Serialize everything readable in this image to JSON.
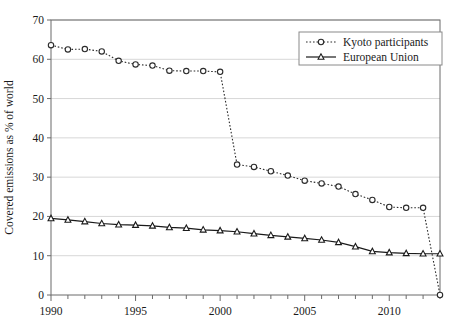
{
  "chart_data": {
    "type": "line",
    "title": "",
    "subtitle": "",
    "xlabel": "",
    "ylabel": "Covered emissions as % of world",
    "xlim": [
      1990,
      2013
    ],
    "ylim": [
      0,
      70
    ],
    "ytick_step": 10,
    "ytick_labels": [
      "0",
      "10",
      "20",
      "30",
      "40",
      "50",
      "60",
      "70"
    ],
    "ytick_values": [
      0,
      10,
      20,
      30,
      40,
      50,
      60,
      70
    ],
    "xtick_labels": [
      "1990",
      "1995",
      "2000",
      "2005",
      "2010"
    ],
    "xtick_values": [
      1990,
      1995,
      2000,
      2005,
      2010
    ],
    "xtick_minor_every": 1,
    "grid": "horizontal",
    "legend_position": "top-right",
    "x": [
      1990,
      1991,
      1992,
      1993,
      1994,
      1995,
      1996,
      1997,
      1998,
      1999,
      2000,
      2001,
      2002,
      2003,
      2004,
      2005,
      2006,
      2007,
      2008,
      2009,
      2010,
      2011,
      2012,
      2013
    ],
    "series": [
      {
        "name": "Kyoto participants",
        "marker": "open-circle",
        "linestyle": "dotted",
        "color": "#2b2b2b",
        "values": [
          63.6,
          62.5,
          62.6,
          62.0,
          59.6,
          58.7,
          58.4,
          57.1,
          57.0,
          57.0,
          56.8,
          33.2,
          32.6,
          31.5,
          30.4,
          29.1,
          28.4,
          27.6,
          25.7,
          24.2,
          22.4,
          22.2,
          22.2,
          0.0
        ]
      },
      {
        "name": "European Union",
        "marker": "open-triangle",
        "linestyle": "solid",
        "color": "#1a1a1a",
        "values": [
          19.5,
          19.1,
          18.7,
          18.2,
          17.9,
          17.8,
          17.6,
          17.2,
          17.0,
          16.6,
          16.4,
          16.1,
          15.6,
          15.2,
          14.8,
          14.4,
          14.0,
          13.4,
          12.3,
          11.1,
          10.8,
          10.6,
          10.5,
          10.5
        ]
      }
    ],
    "legend_entries": [
      {
        "label": "Kyoto participants",
        "marker": "open-circle",
        "linestyle": "dotted"
      },
      {
        "label": "European Union",
        "marker": "open-triangle",
        "linestyle": "solid"
      }
    ]
  }
}
